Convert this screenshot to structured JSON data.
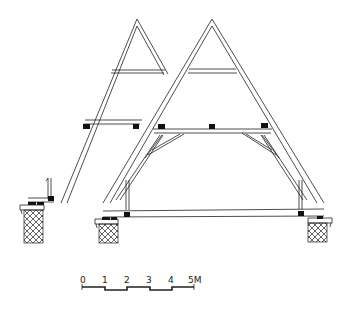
{
  "drawing": {
    "title": "Roof truss cross-sections",
    "frames": [
      {
        "name": "left-truss",
        "type": "partial-section"
      },
      {
        "name": "right-truss",
        "type": "full-section"
      }
    ],
    "scale_bar": {
      "labels": [
        "0",
        "1",
        "2",
        "3",
        "4",
        "5M"
      ],
      "unit": "M"
    },
    "colors": {
      "ink": "#222222",
      "background": "#ffffff"
    }
  }
}
